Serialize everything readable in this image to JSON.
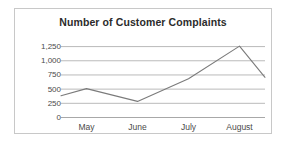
{
  "chart_data": {
    "type": "line",
    "title": "Number of Customer Complaints",
    "xlabel": "",
    "ylabel": "",
    "categories": [
      "May",
      "June",
      "July",
      "August"
    ],
    "x_tick_labels": [
      "May",
      "June",
      "July",
      "August"
    ],
    "y_tick_labels": [
      "0",
      "250",
      "500",
      "750",
      "1,000",
      "1,250"
    ],
    "y_tick_values": [
      0,
      250,
      500,
      750,
      1000,
      1250
    ],
    "ylim": [
      0,
      1375
    ],
    "grid": true,
    "legend": false,
    "legend_position": "none",
    "line_color": "#7b7b7b",
    "series": [
      {
        "name": "Customer Complaints",
        "x": [
          0.0,
          0.5,
          1.5,
          2.5,
          3.5,
          4.0
        ],
        "values": [
          375,
          500,
          275,
          675,
          1250,
          700
        ]
      }
    ]
  },
  "frame": {
    "border_color": "#c8c8c8",
    "background": "#ffffff"
  },
  "axis": {
    "grid_color": "#a8a8a8",
    "tick_text_color": "#4a4a4a"
  }
}
